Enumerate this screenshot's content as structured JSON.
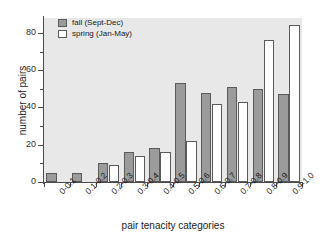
{
  "chart_data": {
    "type": "bar",
    "title": "",
    "xlabel": "pair tenacity categories",
    "ylabel": "number of pairs",
    "categories": [
      "0-0.1",
      "0.1-0.2",
      "0.2-0.3",
      "0.3-0.4",
      "0.4-0.5",
      "0.5-0.6",
      "0.6-0.7",
      "0.7-0.8",
      "0.8-0.9",
      "0.9-1.0"
    ],
    "series": [
      {
        "name": "fall (Sept-Dec)",
        "color": "#9b9b9b",
        "values": [
          5,
          5,
          10,
          16,
          18,
          53,
          48,
          51,
          50,
          47
        ]
      },
      {
        "name": "spring (Jan-May)",
        "color": "#ffffff",
        "values": [
          0,
          0,
          9,
          14,
          16,
          22,
          42,
          43,
          76,
          84
        ]
      }
    ],
    "ylim": [
      0,
      88
    ],
    "yticks": [
      0,
      20,
      40,
      60,
      80
    ],
    "ytick_labels": [
      "0",
      "20",
      "40",
      "60",
      "80"
    ],
    "yminor_ticks": [
      10,
      30,
      50,
      70
    ],
    "grid": false,
    "legend_position": "top-left",
    "plot_background": "#e8e8e8"
  },
  "legend": {
    "entries": [
      {
        "label": "fall (Sept-Dec)",
        "swatch": "fall"
      },
      {
        "label": "spring (Jan-May)",
        "swatch": "spring"
      }
    ]
  }
}
